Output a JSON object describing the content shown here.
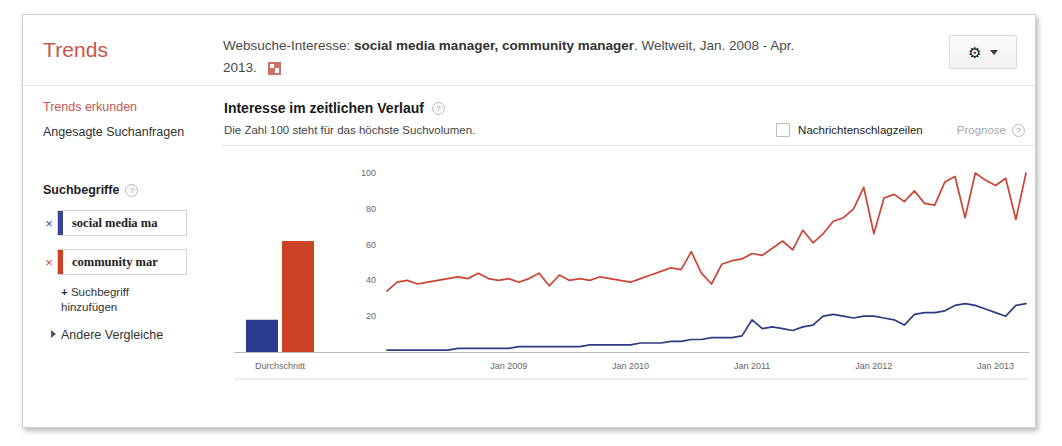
{
  "header": {
    "brand": "Trends",
    "description_prefix": "Websuche-Interesse: ",
    "description_terms": "social media manager, community manager",
    "description_suffix": ". Weltweit, Jan. 2008 - Apr. 2013. ",
    "embed_icon": "embed-image-icon",
    "gear_icon": "gear-icon",
    "caret_icon": "chevron-down-icon"
  },
  "sidebar": {
    "explore_link": "Trends erkunden",
    "trending_link": "Angesagte Suchanfragen",
    "terms_heading": "Suchbegriffe",
    "terms_help": "?",
    "terms": [
      {
        "label": "social media ma",
        "color": "#37469b",
        "remove": "×"
      },
      {
        "label": "community mar",
        "color": "#cc4226",
        "remove": "×"
      }
    ],
    "add_term_plus": "+",
    "add_term_label": "Suchbegriff hinzufügen",
    "other_comparisons": "Andere Vergleiche"
  },
  "main": {
    "title": "Interesse im zeitlichen Verlauf",
    "title_help": "?",
    "note": "Die Zahl 100 steht für das höchste Suchvolumen.",
    "news_checkbox_label": "Nachrichtenschlagzeilen",
    "news_checked": false,
    "forecast_label": "Prognose",
    "forecast_help": "?"
  },
  "chart_data": {
    "type": "line",
    "title": "Interesse im zeitlichen Verlauf",
    "xlabel": "",
    "ylabel": "",
    "ylim": [
      0,
      105
    ],
    "yticks": [
      20,
      40,
      60,
      80,
      100
    ],
    "grid": false,
    "legend_position": "sidebar",
    "average_bars": {
      "category_label": "Durchschnitt",
      "values": [
        {
          "name": "social media manager",
          "value": 18,
          "color": "#2a3a8f"
        },
        {
          "name": "community manager",
          "value": 62,
          "color": "#cc4226"
        }
      ]
    },
    "xtick_labels": [
      "Jan 2009",
      "Jan 2010",
      "Jan 2011",
      "Jan 2012",
      "Jan 2013"
    ],
    "xtick_positions": [
      12,
      24,
      36,
      48,
      60
    ],
    "x_start": "Jan 2008",
    "x_end": "Apr 2013",
    "n_points": 64,
    "series": [
      {
        "name": "community manager",
        "color": "#cc4436",
        "values": [
          34,
          39,
          40,
          38,
          39,
          40,
          41,
          42,
          41,
          44,
          41,
          40,
          41,
          39,
          41,
          44,
          37,
          43,
          40,
          41,
          40,
          42,
          41,
          40,
          39,
          41,
          43,
          45,
          47,
          46,
          56,
          44,
          38,
          49,
          51,
          52,
          55,
          54,
          58,
          62,
          57,
          68,
          61,
          66,
          73,
          75,
          80,
          92,
          66,
          86,
          88,
          84,
          90,
          83,
          82,
          95,
          98,
          75,
          100,
          96,
          93,
          97,
          74,
          100
        ]
      },
      {
        "name": "social media manager",
        "color": "#2d3c7e",
        "values": [
          1,
          1,
          1,
          1,
          1,
          1,
          1,
          2,
          2,
          2,
          2,
          2,
          2,
          3,
          3,
          3,
          3,
          3,
          3,
          3,
          4,
          4,
          4,
          4,
          4,
          5,
          5,
          5,
          6,
          6,
          7,
          7,
          8,
          8,
          8,
          9,
          18,
          13,
          14,
          13,
          12,
          14,
          15,
          20,
          21,
          20,
          19,
          20,
          20,
          19,
          18,
          15,
          21,
          22,
          22,
          23,
          26,
          27,
          26,
          24,
          22,
          20,
          26,
          27
        ]
      }
    ]
  }
}
